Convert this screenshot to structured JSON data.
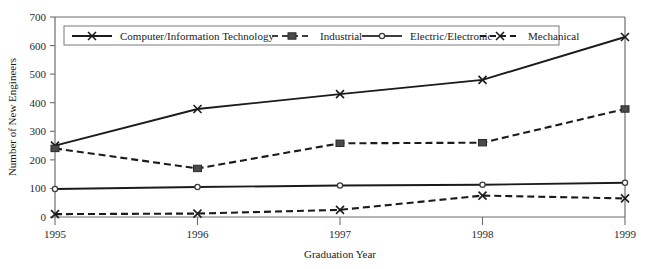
{
  "chart_data": {
    "type": "line",
    "title": "",
    "xlabel": "Graduation Year",
    "ylabel": "Number of New Engineers",
    "x": [
      1995,
      1996,
      1997,
      1998,
      1999
    ],
    "xtick_labels": [
      "1995",
      "1996",
      "1997",
      "1998",
      "1999"
    ],
    "ytick_labels": [
      "0",
      "100",
      "200",
      "300",
      "400",
      "500",
      "600",
      "700"
    ],
    "yticks": [
      0,
      100,
      200,
      300,
      400,
      500,
      600,
      700
    ],
    "ylim": [
      0,
      700
    ],
    "xlim": [
      1995,
      1999
    ],
    "grid": false,
    "legend_position": "top-inside",
    "series": [
      {
        "name": "Computer/Information Technology",
        "values": [
          250,
          378,
          430,
          480,
          630
        ],
        "line_style": "solid",
        "marker": "x",
        "color": "#1b1b1b"
      },
      {
        "name": "Industrial",
        "values": [
          240,
          170,
          258,
          260,
          378
        ],
        "line_style": "dashed",
        "marker": "square",
        "color": "#3d3d3d"
      },
      {
        "name": "Electric/Electronic",
        "values": [
          98,
          105,
          110,
          113,
          120
        ],
        "line_style": "solid",
        "marker": "circle",
        "color": "#3d3d3d"
      },
      {
        "name": "Mechanical",
        "values": [
          10,
          12,
          25,
          75,
          65
        ],
        "line_style": "dashed",
        "marker": "x",
        "color": "#1b1b1b"
      }
    ]
  },
  "legend": {
    "entries": [
      {
        "label": "Computer/Information Technology"
      },
      {
        "label": "Industrial"
      },
      {
        "label": "Electric/Electronic"
      },
      {
        "label": "Mechanical"
      }
    ]
  },
  "axes": {
    "y_title": "Number of New Engineers",
    "x_title": "Graduation Year"
  },
  "colors": {
    "ink": "#1b1b1b",
    "axis": "#6e6e6e",
    "marker_fill": "#4a4a4a",
    "background": "#ffffff"
  }
}
